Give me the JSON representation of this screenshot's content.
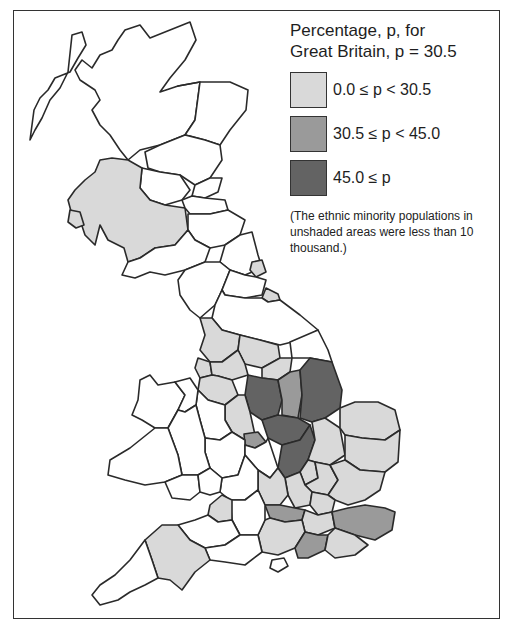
{
  "legend": {
    "title_line1": "Percentage, p, for",
    "title_line2": "Great Britain, p = 30.5",
    "classes": [
      {
        "label": "0.0 ≤ p < 30.5",
        "color": "#d9d9d9"
      },
      {
        "label": "30.5 ≤ p < 45.0",
        "color": "#9a9a9a"
      },
      {
        "label": "45.0 ≤ p",
        "color": "#636363"
      }
    ],
    "note": "(The ethnic minority populations in unshaded areas were less than 10 thousand.)",
    "unshaded_color": "#ffffff"
  },
  "map": {
    "subject": "Great Britain counties choropleth",
    "national_value_p": 30.5
  }
}
